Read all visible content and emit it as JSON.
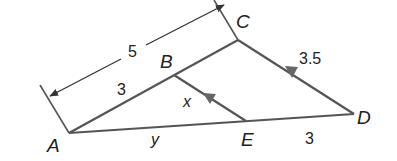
{
  "diagram": {
    "type": "geometry-triangle-parallel-lines",
    "colors": {
      "line": "#555555",
      "arrow": "#666666",
      "text": "#222222"
    },
    "points": {
      "A": {
        "label": "A"
      },
      "B": {
        "label": "B"
      },
      "C": {
        "label": "C"
      },
      "D": {
        "label": "D"
      },
      "E": {
        "label": "E"
      }
    },
    "segments": {
      "AC_dimension": {
        "label": "5"
      },
      "AB": {
        "label": "3"
      },
      "CD": {
        "label": "3.5"
      },
      "BE": {
        "label": "x"
      },
      "AE": {
        "label": "y"
      },
      "ED": {
        "label": "3"
      }
    },
    "parallel_marks": [
      "BE",
      "CD"
    ]
  }
}
